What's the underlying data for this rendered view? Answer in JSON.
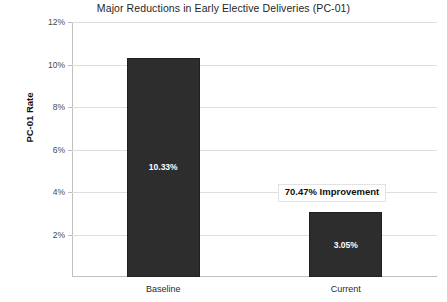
{
  "chart_data": {
    "type": "bar",
    "title": "Major Reductions in Early Elective Deliveries (PC-01)",
    "xlabel": "",
    "ylabel": "PC-01 Rate",
    "categories": [
      "Baseline",
      "Current"
    ],
    "values": [
      10.33,
      3.05
    ],
    "value_labels": [
      "10.33%",
      "3.05%"
    ],
    "ylim": [
      0,
      12
    ],
    "ytick_values": [
      2,
      4,
      6,
      8,
      10,
      12
    ],
    "ytick_labels": [
      "2%",
      "4%",
      "6%",
      "8%",
      "10%",
      "12%"
    ],
    "grid": true,
    "legend": "none",
    "bar_color": "#2d2d2d",
    "annotations": [
      {
        "text": "70.47% Improvement",
        "target_category": "Current"
      }
    ]
  }
}
